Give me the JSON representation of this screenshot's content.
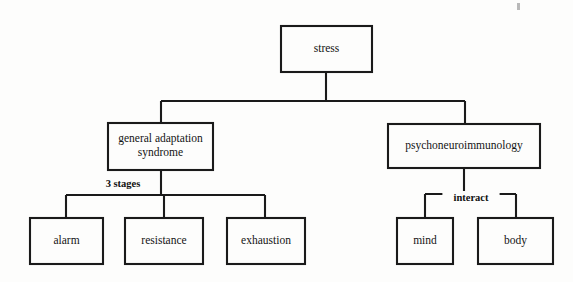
{
  "diagram": {
    "background_color": "#fdfdfc",
    "line_color": "#1a1a1a",
    "text_color": "#141414",
    "nodes": [
      {
        "id": "stress",
        "label": "stress",
        "level": 0,
        "x": 281,
        "y": 26,
        "w": 91,
        "h": 46,
        "lines": [
          "stress"
        ]
      },
      {
        "id": "gas",
        "label": "general adaptation syndrome",
        "level": 1,
        "x": 108,
        "y": 123,
        "w": 105,
        "h": 47,
        "lines": [
          "general adaptation",
          "syndrome"
        ]
      },
      {
        "id": "pni",
        "label": "psychoneuroimmunology",
        "level": 1,
        "x": 388,
        "y": 124,
        "w": 152,
        "h": 44,
        "lines": [
          "psychoneuroimmunology"
        ]
      },
      {
        "id": "alarm",
        "label": "alarm",
        "level": 2,
        "x": 30,
        "y": 218,
        "w": 73,
        "h": 46,
        "lines": [
          "alarm"
        ]
      },
      {
        "id": "resistance",
        "label": "resistance",
        "level": 2,
        "x": 125,
        "y": 218,
        "w": 78,
        "h": 46,
        "lines": [
          "resistance"
        ]
      },
      {
        "id": "exhaustion",
        "label": "exhaustion",
        "level": 2,
        "x": 227,
        "y": 218,
        "w": 78,
        "h": 46,
        "lines": [
          "exhaustion"
        ]
      },
      {
        "id": "mind",
        "label": "mind",
        "level": 2,
        "x": 397,
        "y": 218,
        "w": 56,
        "h": 46,
        "lines": [
          "mind"
        ]
      },
      {
        "id": "body",
        "label": "body",
        "level": 2,
        "x": 478,
        "y": 218,
        "w": 75,
        "h": 46,
        "lines": [
          "body"
        ]
      }
    ],
    "edges": [
      {
        "id": "stress-to-children",
        "from": "stress",
        "to": [
          "gas",
          "pni"
        ],
        "label": ""
      },
      {
        "id": "gas-to-stages",
        "from": "gas",
        "to": [
          "alarm",
          "resistance",
          "exhaustion"
        ],
        "label": "3 stages"
      },
      {
        "id": "pni-to-parts",
        "from": "pni",
        "to": [
          "mind",
          "body"
        ],
        "label": "interact"
      }
    ],
    "edge_labels": [
      {
        "id": "three-stages",
        "text": "3 stages",
        "x": 123,
        "y": 185
      },
      {
        "id": "interact",
        "text": "interact",
        "x": 471,
        "y": 199
      }
    ],
    "connector_geometry": {
      "root_stem": {
        "x": 326,
        "y1": 72,
        "y2": 101
      },
      "root_bar": {
        "x1": 161,
        "x2": 465,
        "y": 101
      },
      "root_drops": [
        {
          "x": 161,
          "y1": 101,
          "y2": 123
        },
        {
          "x": 465,
          "y1": 101,
          "y2": 124
        }
      ],
      "gas_stem": {
        "x": 161,
        "y1": 170,
        "y2": 195
      },
      "gas_bar": {
        "x1": 66,
        "x2": 265,
        "y": 195
      },
      "gas_drops": [
        {
          "x": 66,
          "y1": 195,
          "y2": 218
        },
        {
          "x": 164,
          "y1": 195,
          "y2": 218
        },
        {
          "x": 265,
          "y1": 195,
          "y2": 218
        }
      ],
      "pni_stem": {
        "x": 464,
        "y1": 168,
        "y2": 194
      },
      "pni_bar": {
        "x1": 425,
        "x2": 516,
        "y": 194
      },
      "pni_drops": [
        {
          "x": 425,
          "y1": 194,
          "y2": 218
        },
        {
          "x": 516,
          "y1": 194,
          "y2": 218
        }
      ]
    },
    "artifact": {
      "id": "scan-speck",
      "x": 517,
      "y": 3,
      "w": 3,
      "h": 7
    }
  }
}
